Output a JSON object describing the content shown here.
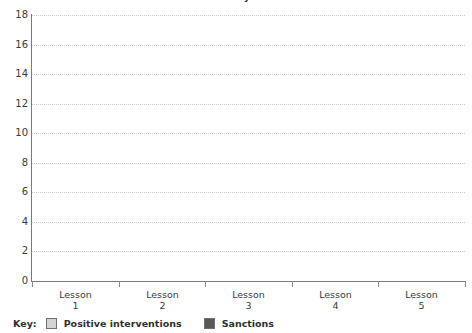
{
  "chart_data": {
    "type": "bar",
    "title": "Positive interventions and sanctions by the class",
    "xlabel": "",
    "ylabel": "",
    "categories": [
      "Lesson 1",
      "Lesson 2",
      "Lesson 3",
      "Lesson 4",
      "Lesson 5"
    ],
    "category_lines": [
      {
        "line1": "Lesson",
        "line2": "1"
      },
      {
        "line1": "Lesson",
        "line2": "2"
      },
      {
        "line1": "Lesson",
        "line2": "3"
      },
      {
        "line1": "Lesson",
        "line2": "4"
      },
      {
        "line1": "Lesson",
        "line2": "5"
      }
    ],
    "ylim": [
      0,
      18
    ],
    "ytick_step": 2,
    "yticks": [
      18,
      16,
      14,
      12,
      10,
      8,
      6,
      4,
      2,
      0
    ],
    "grid": true,
    "grid_style": "dotted",
    "legend_position": "bottom-left",
    "series": [
      {
        "name": "Positive interventions",
        "color": "#d4d4d4",
        "values": [
          0,
          0,
          0,
          0,
          0
        ]
      },
      {
        "name": "Sanctions",
        "color": "#585858",
        "values": [
          0,
          0,
          0,
          0,
          0
        ]
      }
    ]
  },
  "legend": {
    "title": "Key:",
    "items": [
      {
        "label": "Positive interventions",
        "color": "#d4d4d4"
      },
      {
        "label": "Sanctions",
        "color": "#585858"
      }
    ]
  },
  "colors": {
    "axis": "#7a7a7a",
    "grid": "#c9c9c9",
    "text": "#3a3a3a",
    "positive_interventions": "#d4d4d4",
    "sanctions": "#585858",
    "background": "#ffffff"
  }
}
